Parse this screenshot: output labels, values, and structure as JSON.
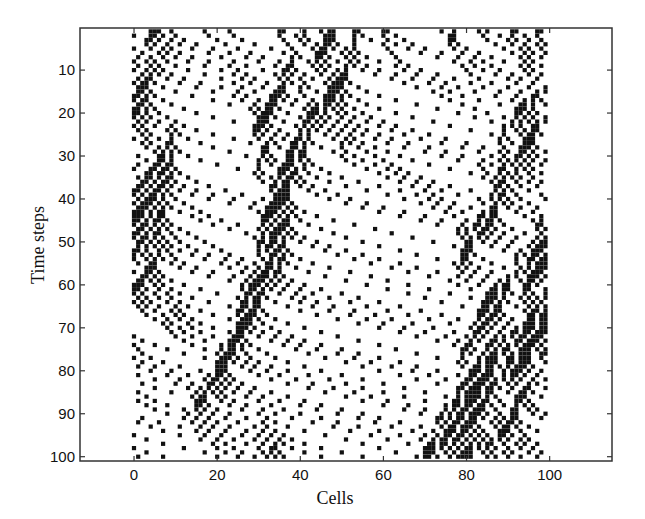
{
  "chart_data": {
    "type": "scatter",
    "title": "",
    "xlabel": "Cells",
    "ylabel": "Time steps",
    "xlim": [
      -13,
      115
    ],
    "ylim": [
      101,
      0.2
    ],
    "y_inverted": true,
    "grid": false,
    "legend": null,
    "x_ticks": [
      0,
      20,
      40,
      60,
      80,
      100
    ],
    "x_tick_labels": [
      "0",
      "20",
      "40",
      "60",
      "80",
      "100"
    ],
    "y_ticks": [
      10,
      20,
      30,
      40,
      50,
      60,
      70,
      80,
      90,
      100
    ],
    "y_tick_labels": [
      "10",
      "20",
      "30",
      "40",
      "50",
      "60",
      "70",
      "80",
      "90",
      "100"
    ],
    "marker": "square",
    "marker_color": "#111111",
    "series": [
      {
        "name": "occupied cells",
        "model": {
          "kind": "Nagel-Schreckenberg",
          "lattice_cells": 100,
          "vehicles": 24,
          "vmax": 5,
          "slowdown_probability": 0.3,
          "time_steps": 100,
          "seed": 7
        }
      }
    ]
  },
  "plot": {
    "frame_color": "#333333",
    "background": "#ffffff"
  }
}
